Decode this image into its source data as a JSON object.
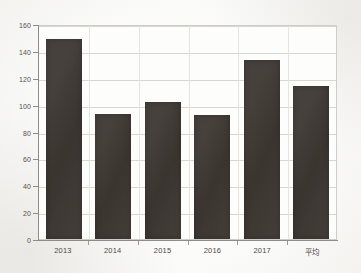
{
  "chart_data": {
    "type": "bar",
    "title": "",
    "subtitle": "",
    "xlabel": "",
    "ylabel": "",
    "categories": [
      "2013",
      "2014",
      "2015",
      "2016",
      "2017",
      "平均"
    ],
    "values": [
      149,
      93,
      102,
      92,
      133,
      114
    ],
    "series": [
      {
        "name": "",
        "values": [
          149,
          93,
          102,
          92,
          133,
          114
        ]
      }
    ],
    "ylim": [
      0,
      160
    ],
    "yticks": [
      0,
      20,
      40,
      60,
      80,
      100,
      120,
      140,
      160
    ],
    "ytick_labels": [
      "0",
      "20",
      "40",
      "60",
      "80",
      "100",
      "120",
      "140",
      "160"
    ],
    "grid": true,
    "grid_axis": "y",
    "legend": false,
    "legend_position": "none",
    "bar_color": "#3e3833",
    "plot_background": "#fdfdfb",
    "figure_background": "#fbfbf9",
    "grid_color": "#d8d6cf",
    "axis_color": "#8e8c86"
  }
}
